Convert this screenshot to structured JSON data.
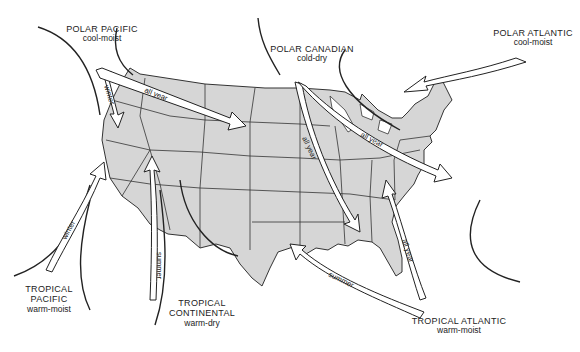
{
  "map": {
    "land_fill": "#d6d6d6",
    "border_color": "#333333",
    "arrow_fill": "#ffffff",
    "air_masses": [
      {
        "id": "polar-pacific",
        "name": "POLAR PACIFIC",
        "desc": "cool-moist"
      },
      {
        "id": "polar-canadian",
        "name": "POLAR CANADIAN",
        "desc": "cold-dry"
      },
      {
        "id": "polar-atlantic",
        "name": "POLAR ATLANTIC",
        "desc": "cool-moist"
      },
      {
        "id": "tropical-pacific",
        "name": "TROPICAL PACIFIC",
        "name_line1": "TROPICAL",
        "name_line2": "PACIFIC",
        "desc": "warm-moist"
      },
      {
        "id": "tropical-continental",
        "name": "TROPICAL CONTINENTAL",
        "name_line1": "TROPICAL",
        "name_line2": "CONTINENTAL",
        "desc": "warm-dry"
      },
      {
        "id": "tropical-atlantic",
        "name": "TROPICAL ATLANTIC",
        "desc": "warm-moist"
      }
    ],
    "arrow_labels": {
      "pp_winter": "winter",
      "pp_all_year": "all year",
      "pc_all_year_west": "all year",
      "pc_all_year_east": "all year",
      "tp_winter": "winter",
      "tc_summer": "summer",
      "ta_summer": "summer",
      "ta_all_year": "all year"
    }
  }
}
